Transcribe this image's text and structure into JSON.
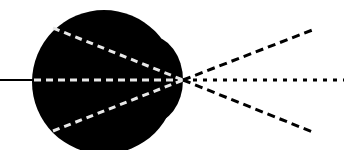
{
  "diagram": {
    "title": "",
    "colors": {
      "background": "#ffffff",
      "eye_fill": "#000000",
      "inner_lines": "#e8e8e8",
      "outer_lines": "#000000"
    },
    "eyeball": {
      "cx": 104,
      "cy": 82,
      "r": 72
    },
    "cornea": {
      "cx": 150,
      "cy": 80,
      "rx": 33,
      "ry": 44
    },
    "focal_point": {
      "x": 183,
      "y": 80
    },
    "optic_nerve": {
      "x1": 0,
      "y1": 80,
      "x2": 34,
      "y2": 80
    },
    "inner_rays": [
      {
        "name": "upper",
        "x1": 53,
        "y1": 28,
        "x2": 183,
        "y2": 80
      },
      {
        "name": "middle",
        "x1": 34,
        "y1": 80,
        "x2": 183,
        "y2": 80
      },
      {
        "name": "lower",
        "x1": 53,
        "y1": 131,
        "x2": 183,
        "y2": 80
      }
    ],
    "outer_rays": [
      {
        "name": "upper",
        "x1": 183,
        "y1": 80,
        "x2": 315,
        "y2": 29,
        "style": "dashed"
      },
      {
        "name": "middle",
        "x1": 183,
        "y1": 80,
        "x2": 344,
        "y2": 80,
        "style": "dotted"
      },
      {
        "name": "lower",
        "x1": 183,
        "y1": 80,
        "x2": 315,
        "y2": 133,
        "style": "dashed"
      }
    ]
  }
}
